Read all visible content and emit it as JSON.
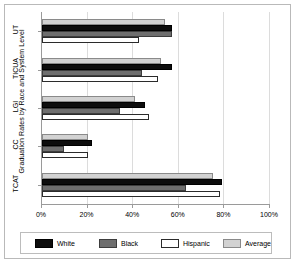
{
  "chart_data": {
    "type": "bar",
    "orientation": "horizontal",
    "title": "",
    "xlabel": "",
    "ylabel": "Graduation Rates by Race and System Level",
    "categories": [
      "UT",
      "TICUA",
      "LGI",
      "CC",
      "TCAT"
    ],
    "series": [
      {
        "name": "White",
        "color": "#0d0d0d",
        "values": [
          57,
          57,
          45,
          22,
          79
        ]
      },
      {
        "name": "Black",
        "color": "#6e6e6e",
        "values": [
          57,
          44,
          34,
          9.5,
          63
        ]
      },
      {
        "name": "Hispanic",
        "color": "#ffffff",
        "values": [
          42.5,
          51,
          47,
          20,
          78
        ]
      },
      {
        "name": "Average",
        "color": "#d2d2d2",
        "values": [
          54,
          52,
          41,
          20,
          75
        ]
      }
    ],
    "xlim": [
      0,
      100
    ],
    "xticks": [
      0,
      20,
      40,
      60,
      80,
      100
    ],
    "xtick_labels": [
      "0%",
      "20%",
      "40%",
      "60%",
      "80%",
      "100%"
    ],
    "grid": true,
    "legend_position": "bottom",
    "legend_entries": [
      "White",
      "Black",
      "Hispanic",
      "Average"
    ]
  }
}
